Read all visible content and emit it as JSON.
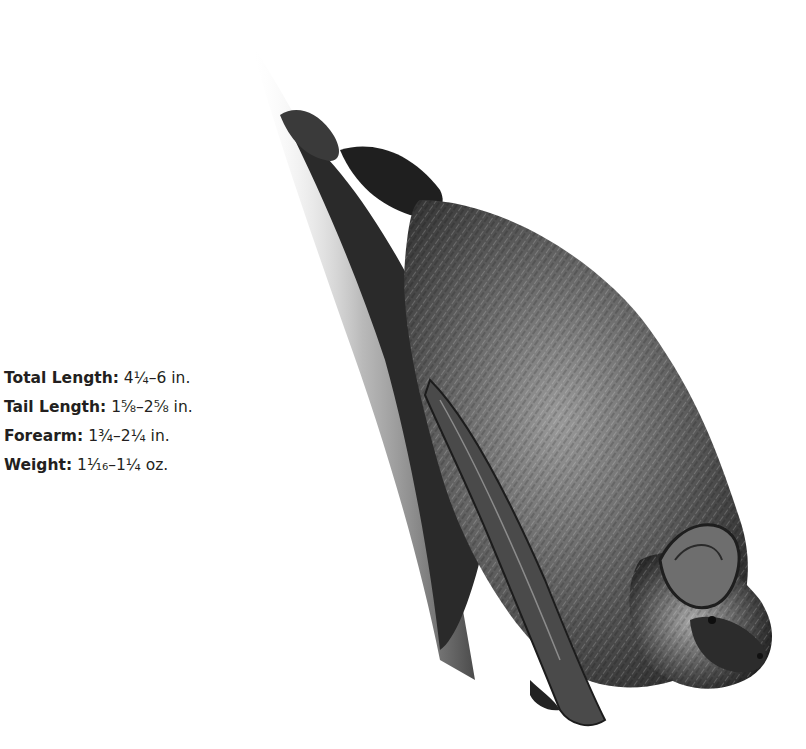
{
  "illustration": {
    "subject": "bat hanging upside down on bark",
    "icon": "bat-illustration"
  },
  "measurements": [
    {
      "label": "Total Length:",
      "value": "4¼–6 in."
    },
    {
      "label": "Tail Length:",
      "value": "1⅝–2⅝ in."
    },
    {
      "label": "Forearm:",
      "value": "1¾–2¼ in."
    },
    {
      "label": "Weight:",
      "value": "1⅟₁₆–1¼ oz."
    }
  ],
  "colors": {
    "text": "#231f20",
    "fur_dark": "#2a2a2a",
    "fur_mid": "#6b6b6b",
    "fur_light": "#bdbdbd",
    "background": "#ffffff"
  }
}
